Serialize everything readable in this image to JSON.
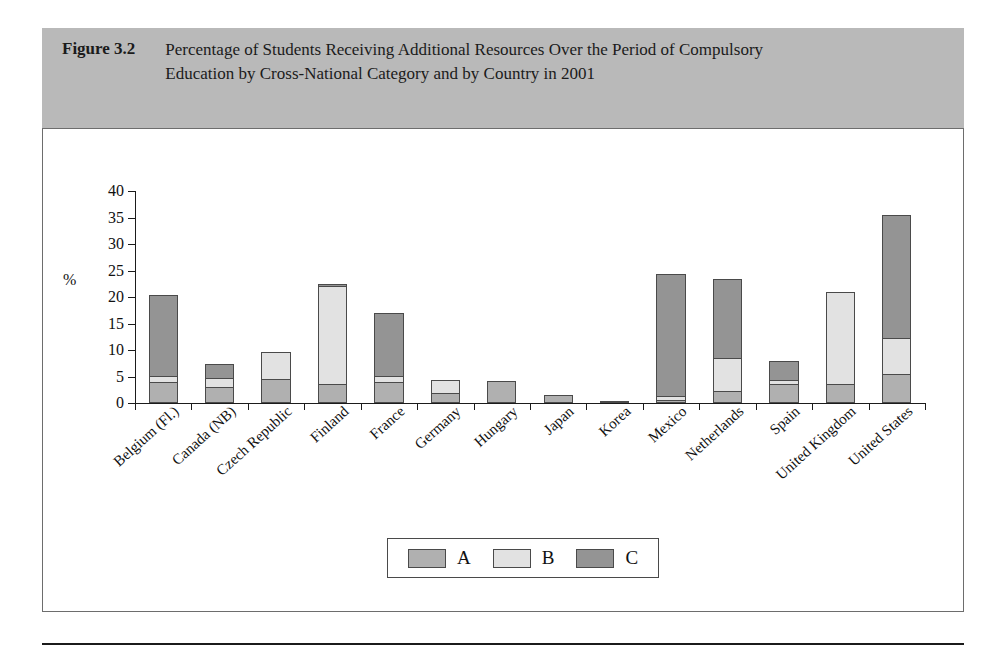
{
  "figure": {
    "label": "Figure 3.2",
    "title": "Percentage of Students Receiving Additional Resources Over the Period of Compulsory Education by Cross-National Category and by Country in 2001"
  },
  "chart_data": {
    "type": "bar",
    "subtype": "stacked-vertical",
    "title": "Percentage of Students Receiving Additional Resources Over the Period of Compulsory Education by Cross-National Category and by Country in 2001",
    "xlabel": "",
    "ylabel": "%",
    "ylim": [
      0,
      40
    ],
    "yticks": [
      0,
      5,
      10,
      15,
      20,
      25,
      30,
      35,
      40
    ],
    "ytick_labels": [
      "0",
      "5",
      "10",
      "15",
      "20",
      "25",
      "30",
      "35",
      "40"
    ],
    "grid": false,
    "legend_position": "bottom-center",
    "legend_entries": [
      "A",
      "B",
      "C"
    ],
    "categories": [
      "Belgium (Fl.)",
      "Canada (NB)",
      "Czech Republic",
      "Finland",
      "France",
      "Germany",
      "Hungary",
      "Japan",
      "Korea",
      "Mexico",
      "Netherlands",
      "Spain",
      "United Kingdom",
      "United States"
    ],
    "series": [
      {
        "name": "A",
        "color": "#b0b0b0",
        "values": [
          4.0,
          3.0,
          4.5,
          3.5,
          4.0,
          1.8,
          4.2,
          1.6,
          0.4,
          0.5,
          2.2,
          3.5,
          3.6,
          5.4
        ]
      },
      {
        "name": "B",
        "color": "#e2e2e2",
        "values": [
          1.3,
          2.0,
          5.3,
          18.7,
          1.3,
          2.7,
          0.0,
          0.0,
          0.0,
          1.0,
          6.5,
          1.0,
          17.6,
          7.1
        ]
      },
      {
        "name": "C",
        "color": "#949494",
        "values": [
          15.4,
          2.8,
          0.0,
          0.6,
          12.0,
          0.0,
          0.0,
          0.0,
          0.0,
          23.2,
          15.0,
          3.8,
          0.0,
          23.4
        ]
      }
    ],
    "totals": [
      20.7,
      7.8,
      9.8,
      22.8,
      17.3,
      4.5,
      4.2,
      1.6,
      0.4,
      24.7,
      23.7,
      8.3,
      21.2,
      35.9
    ]
  },
  "colors": {
    "header_band": "#b9b9b9",
    "series_a": "#b0b0b0",
    "series_b": "#e2e2e2",
    "series_c": "#949494",
    "axis": "#1b1b1b",
    "frame_border": "#6d6d6d"
  }
}
